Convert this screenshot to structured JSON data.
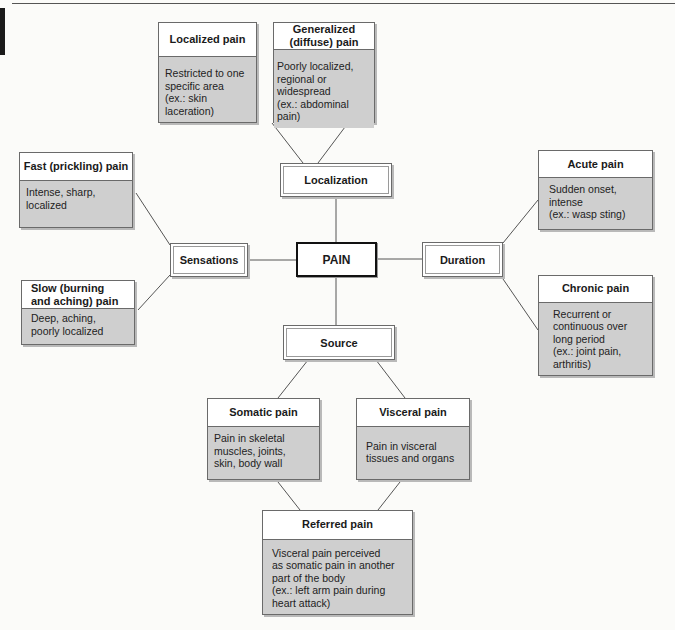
{
  "diagram": {
    "center": {
      "label": "PAIN"
    },
    "categories": {
      "localization": {
        "label": "Localization"
      },
      "sensations": {
        "label": "Sensations"
      },
      "duration": {
        "label": "Duration"
      },
      "source": {
        "label": "Source"
      }
    },
    "cards": {
      "localized": {
        "title": "Localized pain",
        "body": "Restricted to one\n specific area\n (ex.: skin laceration)"
      },
      "generalized": {
        "title": "Generalized\n(diffuse) pain",
        "body": "Poorly localized,\n regional or widespread\n (ex.: abdominal pain)"
      },
      "fast": {
        "title": "Fast (prickling) pain",
        "body": "Intense, sharp,\n localized"
      },
      "slow": {
        "title": "Slow (burning\n and aching) pain",
        "body": "Deep, aching,\n poorly localized"
      },
      "acute": {
        "title": "Acute pain",
        "body": "Sudden onset,\n intense\n (ex.: wasp sting)"
      },
      "chronic": {
        "title": "Chronic pain",
        "body": "Recurrent or\n continuous over\n long period\n (ex.: joint pain,\n arthritis)"
      },
      "somatic": {
        "title": "Somatic pain",
        "body": "Pain in skeletal\n muscles, joints,\n skin, body wall"
      },
      "visceral": {
        "title": "Visceral pain",
        "body": "\nPain in visceral\n tissues and organs"
      },
      "referred": {
        "title": "Referred pain",
        "body": "Visceral pain perceived\n as somatic pain in another\n part of the body\n (ex.: left arm pain during\n heart attack)"
      }
    },
    "colors": {
      "card_body": "#cfcfcf",
      "card_header": "#ffffff",
      "line": "#555555",
      "background": "#fbfbf9"
    }
  }
}
